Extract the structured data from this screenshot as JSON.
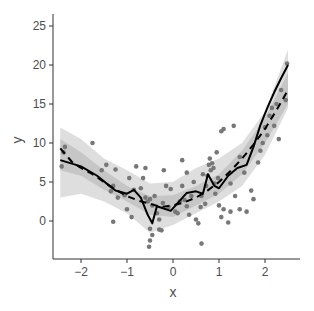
{
  "chart_data": {
    "type": "scatter",
    "title": "",
    "xlabel": "x",
    "ylabel": "y",
    "xlim": [
      -2.65,
      2.75
    ],
    "ylim": [
      -4.9,
      26.7
    ],
    "xticks": [
      -2,
      -1,
      0,
      1,
      2
    ],
    "yticks": [
      0,
      5,
      10,
      15,
      20,
      25
    ],
    "grid": false,
    "legend": "none",
    "colors": {
      "points": "#777777",
      "band": "#c8c8c8",
      "line": "#000000"
    },
    "points": [
      [
        -2.42,
        7.0
      ],
      [
        -2.38,
        8.8
      ],
      [
        -2.35,
        9.5
      ],
      [
        -1.75,
        10.0
      ],
      [
        -1.55,
        6.5
      ],
      [
        -1.45,
        7.2
      ],
      [
        -1.3,
        4.5
      ],
      [
        -1.25,
        6.6
      ],
      [
        -1.2,
        3.0
      ],
      [
        -1.35,
        3.8
      ],
      [
        -1.05,
        3.3
      ],
      [
        -0.95,
        5.5
      ],
      [
        -0.85,
        4.0
      ],
      [
        -0.8,
        7.0
      ],
      [
        -0.7,
        4.2
      ],
      [
        -0.65,
        5.5
      ],
      [
        -0.6,
        3.0
      ],
      [
        -0.55,
        2.5
      ],
      [
        -0.5,
        2.8
      ],
      [
        -0.45,
        2.0
      ],
      [
        -0.4,
        3.2
      ],
      [
        -0.35,
        1.0
      ],
      [
        -0.3,
        0.2
      ],
      [
        -0.22,
        2.3
      ],
      [
        -0.15,
        4.5
      ],
      [
        -0.1,
        1.8
      ],
      [
        -0.5,
        -1.0
      ],
      [
        -0.45,
        -1.8
      ],
      [
        -0.5,
        -2.5
      ],
      [
        -0.52,
        -3.3
      ],
      [
        -0.9,
        0.5
      ],
      [
        -1.0,
        1.5
      ],
      [
        -1.3,
        -0.1
      ],
      [
        -0.3,
        -1.1
      ],
      [
        -0.25,
        -1.2
      ],
      [
        -0.6,
        6.8
      ],
      [
        -0.2,
        6.5
      ],
      [
        -0.05,
        4.1
      ],
      [
        0.05,
        1.2
      ],
      [
        0.1,
        1.0
      ],
      [
        0.15,
        2.5
      ],
      [
        0.2,
        4.5
      ],
      [
        0.25,
        2.7
      ],
      [
        0.3,
        1.9
      ],
      [
        0.35,
        0.8
      ],
      [
        0.4,
        3.2
      ],
      [
        0.45,
        5.0
      ],
      [
        0.5,
        0.2
      ],
      [
        0.55,
        -0.3
      ],
      [
        0.6,
        1.8
      ],
      [
        0.62,
        3.2
      ],
      [
        0.65,
        6.0
      ],
      [
        0.7,
        2.2
      ],
      [
        0.72,
        4.5
      ],
      [
        0.75,
        5.8
      ],
      [
        0.78,
        7.2
      ],
      [
        0.8,
        8.0
      ],
      [
        0.82,
        6.5
      ],
      [
        0.85,
        7.4
      ],
      [
        0.88,
        6.8
      ],
      [
        0.9,
        4.8
      ],
      [
        0.92,
        3.5
      ],
      [
        0.95,
        8.8
      ],
      [
        0.98,
        5.5
      ],
      [
        1.0,
        2.0
      ],
      [
        1.05,
        0.5
      ],
      [
        1.1,
        1.5
      ],
      [
        1.2,
        -0.2
      ],
      [
        1.25,
        1.2
      ],
      [
        0.62,
        -2.9
      ],
      [
        1.05,
        11.5
      ],
      [
        1.32,
        12.2
      ],
      [
        1.25,
        4.8
      ],
      [
        1.35,
        3.2
      ],
      [
        1.45,
        1.5
      ],
      [
        1.6,
        1.2
      ],
      [
        1.7,
        3.9
      ],
      [
        1.75,
        2.8
      ],
      [
        1.85,
        7.5
      ],
      [
        1.9,
        9.0
      ],
      [
        1.95,
        10.0
      ],
      [
        2.0,
        12.0
      ],
      [
        2.05,
        11.0
      ],
      [
        2.1,
        13.5
      ],
      [
        2.15,
        14.5
      ],
      [
        2.2,
        12.2
      ],
      [
        2.25,
        15.0
      ],
      [
        2.35,
        16.8
      ],
      [
        2.45,
        15.5
      ],
      [
        2.48,
        20.2
      ],
      [
        2.3,
        10.5
      ],
      [
        1.1,
        11.8
      ],
      [
        1.45,
        8.2
      ],
      [
        1.55,
        6.2
      ],
      [
        0.3,
        6.2
      ],
      [
        0.2,
        7.8
      ]
    ],
    "series": [
      {
        "name": "solid-smooth",
        "style": "solid",
        "x": [
          -2.45,
          -2.0,
          -1.65,
          -1.4,
          -1.25,
          -1.0,
          -0.85,
          -0.7,
          -0.55,
          -0.45,
          -0.35,
          -0.2,
          -0.05,
          0.1,
          0.3,
          0.5,
          0.65,
          0.76,
          0.9,
          1.0,
          1.2,
          1.4,
          1.6,
          1.75,
          1.9,
          2.05,
          2.2,
          2.35,
          2.5
        ],
        "y": [
          7.8,
          7.0,
          5.8,
          4.6,
          3.9,
          3.5,
          4.0,
          3.0,
          0.8,
          -0.3,
          1.9,
          1.6,
          1.3,
          2.3,
          3.6,
          3.8,
          3.5,
          6.0,
          4.5,
          4.2,
          5.8,
          6.8,
          7.2,
          9.5,
          12.3,
          14.5,
          16.5,
          18.3,
          20.0
        ]
      },
      {
        "name": "dashed-smooth",
        "style": "dashed",
        "x": [
          -2.45,
          -2.2,
          -2.0,
          -1.75,
          -1.5,
          -1.25,
          -1.0,
          -0.75,
          -0.5,
          -0.25,
          0.0,
          0.25,
          0.5,
          0.75,
          1.0,
          1.25,
          1.5,
          1.75,
          2.0,
          2.25,
          2.5
        ],
        "y": [
          9.3,
          7.6,
          6.8,
          6.0,
          5.0,
          4.0,
          3.2,
          2.6,
          2.2,
          1.8,
          2.0,
          2.4,
          3.0,
          3.9,
          5.0,
          6.4,
          8.0,
          9.8,
          11.8,
          14.2,
          16.8
        ]
      }
    ],
    "band_outer": {
      "x": [
        -2.45,
        -2.0,
        -1.5,
        -1.0,
        -0.5,
        0.0,
        0.5,
        1.0,
        1.5,
        2.0,
        2.5
      ],
      "lower": [
        3.0,
        3.5,
        2.5,
        1.0,
        -1.5,
        -0.5,
        1.0,
        2.5,
        4.5,
        8.5,
        14.5
      ],
      "upper": [
        12.0,
        10.5,
        8.0,
        6.5,
        4.8,
        5.0,
        6.8,
        8.0,
        10.0,
        14.0,
        22.0
      ]
    },
    "band_inner": {
      "x": [
        -2.45,
        -2.0,
        -1.5,
        -1.0,
        -0.5,
        0.0,
        0.5,
        1.0,
        1.5,
        2.0,
        2.5
      ],
      "lower": [
        6.5,
        5.8,
        4.0,
        2.5,
        0.8,
        0.5,
        2.0,
        3.5,
        6.0,
        10.0,
        15.0
      ],
      "upper": [
        10.5,
        8.8,
        6.5,
        4.5,
        3.2,
        3.3,
        4.5,
        6.0,
        9.0,
        13.2,
        19.0
      ]
    }
  }
}
